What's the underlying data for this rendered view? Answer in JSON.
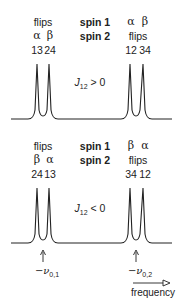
{
  "panels": [
    {
      "id": "top",
      "left_group": {
        "header": "flips",
        "spin1": "α",
        "spin2": "β",
        "trans_a": "13",
        "trans_b": "24"
      },
      "center": {
        "spin1_label": "spin 1",
        "spin2_label": "spin 2"
      },
      "right_group": {
        "spin1a": "α",
        "spin1b": "β",
        "header": "flips",
        "trans_a": "12",
        "trans_b": "34"
      },
      "condition": {
        "symbol": "J",
        "sub": "12",
        "rel": " > 0"
      }
    },
    {
      "id": "bottom",
      "left_group": {
        "header": "flips",
        "spin1": "β",
        "spin2": "α",
        "trans_a": "24",
        "trans_b": "13"
      },
      "center": {
        "spin1_label": "spin 1",
        "spin2_label": "spin 2"
      },
      "right_group": {
        "spin1a": "β",
        "spin1b": "α",
        "header": "flips",
        "trans_a": "34",
        "trans_b": "12"
      },
      "condition": {
        "symbol": "J",
        "sub": "12",
        "rel": " < 0"
      }
    }
  ],
  "markers": [
    {
      "prefix": "−ν",
      "sub": "0,1"
    },
    {
      "prefix": "−ν",
      "sub": "0,2"
    }
  ],
  "axis": {
    "label": "frequency"
  },
  "colors": {
    "line": "#222222",
    "text": "#222222"
  }
}
